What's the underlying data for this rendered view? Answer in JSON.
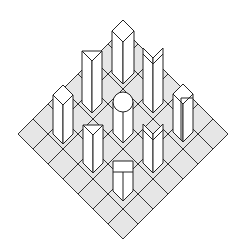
{
  "diagram": {
    "title": "",
    "grid": {
      "rows": 7,
      "cols": 7,
      "corners": {
        "left": [
          18,
          134
        ],
        "top": [
          123,
          29
        ],
        "right": [
          228,
          134
        ],
        "bottom": [
          123,
          238
        ]
      },
      "cell_fill": "#e6e6e6",
      "line_color": "#333333"
    },
    "prisms": [
      {
        "id": "top",
        "shape": "diamond-prism",
        "cx": 123,
        "top": 20,
        "bottom": 84,
        "halfw": 11
      },
      {
        "id": "upper-left",
        "shape": "triangular-prism",
        "cx": 92,
        "top": 51,
        "bottom": 113,
        "halfw": 10
      },
      {
        "id": "upper-right",
        "shape": "chevron-prism",
        "cx": 153,
        "top": 48,
        "bottom": 113,
        "halfw": 10
      },
      {
        "id": "left",
        "shape": "diamond-prism",
        "cx": 63,
        "top": 85,
        "bottom": 144,
        "halfw": 10
      },
      {
        "id": "center",
        "shape": "cylinder",
        "cx": 123,
        "top": 92,
        "bottom": 143,
        "halfw": 10
      },
      {
        "id": "right",
        "shape": "l-prism",
        "cx": 183,
        "top": 84,
        "bottom": 142,
        "halfw": 10
      },
      {
        "id": "lower-left",
        "shape": "triangular-prism",
        "cx": 93,
        "top": 125,
        "bottom": 173,
        "halfw": 10
      },
      {
        "id": "lower-right",
        "shape": "chevron-prism",
        "cx": 153,
        "top": 124,
        "bottom": 173,
        "halfw": 10
      },
      {
        "id": "bottom",
        "shape": "square-prism",
        "cx": 123,
        "top": 161,
        "bottom": 201,
        "halfw": 10
      }
    ]
  }
}
